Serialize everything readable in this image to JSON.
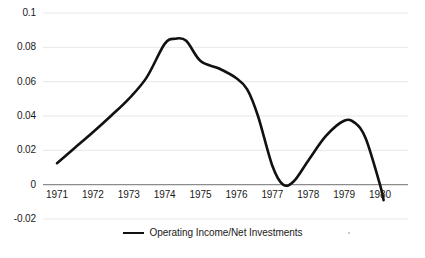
{
  "chart_data": {
    "type": "line",
    "title": "",
    "xlabel": "",
    "ylabel": "",
    "xlim": [
      1971,
      1980
    ],
    "ylim": [
      -0.02,
      0.1
    ],
    "grid": true,
    "legend_position": "bottom",
    "x_ticks": [
      "1971",
      "1972",
      "1973",
      "1974",
      "1975",
      "1976",
      "1977",
      "1978",
      "1979",
      "1980"
    ],
    "y_ticks": [
      "0.1",
      "0.08",
      "0.06",
      "0.04",
      "0.02",
      "0",
      "-0.02"
    ],
    "y_tick_values": [
      0.1,
      0.08,
      0.06,
      0.04,
      0.02,
      0,
      -0.02
    ],
    "zero_line": 0,
    "series": [
      {
        "name": "Operating Income/Net Investments",
        "color": "#111111",
        "x": [
          1971,
          1971.5,
          1972,
          1972.5,
          1973,
          1973.5,
          1974,
          1974.3,
          1974.6,
          1975,
          1975.5,
          1976,
          1976.3,
          1976.6,
          1977,
          1977.3,
          1977.6,
          1978,
          1978.5,
          1979,
          1979.3,
          1979.6,
          1980,
          1980.1
        ],
        "values": [
          0.0125,
          0.0215,
          0.0305,
          0.04,
          0.05,
          0.0625,
          0.082,
          0.085,
          0.0838,
          0.072,
          0.0678,
          0.062,
          0.0555,
          0.04,
          0.011,
          0.0,
          0.002,
          0.014,
          0.0285,
          0.0372,
          0.036,
          0.027,
          0.0,
          -0.009
        ]
      }
    ],
    "legend": [
      {
        "label": "Operating Income/Net Investments",
        "color": "#111111"
      }
    ],
    "colors": {
      "line": "#111111",
      "gridline": "#e4e4e4",
      "axis": "#8c8c8c",
      "text": "#1a1a1a",
      "background": "#ffffff"
    }
  }
}
